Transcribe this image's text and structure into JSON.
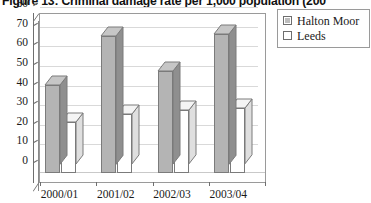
{
  "title": "Figure 13: Criminal damage rate per 1,000 population (200",
  "legend": {
    "items": [
      {
        "label": "Halton Moor",
        "marker": "legend-swatch-hatched",
        "color": "#bdbdbd"
      },
      {
        "label": "Leeds",
        "marker": "legend-swatch-empty",
        "color": "#ffffff"
      }
    ]
  },
  "axes": {
    "y_ticks": [
      "80",
      "70",
      "60",
      "50",
      "40",
      "30",
      "20",
      "10",
      "0"
    ],
    "x_ticks": [
      "2000/01",
      "2001/02",
      "2002/03",
      "2003/04"
    ]
  },
  "chart_data": {
    "type": "bar",
    "title": "Figure 13: Criminal damage rate per 1,000 population (200",
    "xlabel": "",
    "ylabel": "",
    "ylim": [
      0,
      80
    ],
    "ytick_step": 10,
    "grid": true,
    "legend_position": "top-right",
    "categories": [
      "2000/01",
      "2001/02",
      "2002/03",
      "2003/04"
    ],
    "series": [
      {
        "name": "Halton Moor",
        "color": "#b4b4b4",
        "values": [
          45,
          70,
          52,
          71
        ]
      },
      {
        "name": "Leeds",
        "color": "#ffffff",
        "values": [
          26,
          30,
          32,
          33
        ]
      }
    ]
  }
}
